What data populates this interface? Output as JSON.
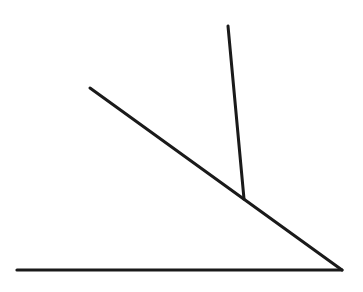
{
  "diagram": {
    "background": "#ffffff",
    "stroke_color": "#1a1a1a",
    "lines": [
      {
        "name": "base-line",
        "x1": 17,
        "y1": 270,
        "x2": 342,
        "y2": 270,
        "width": 3.2
      },
      {
        "name": "diagonal-line",
        "x1": 90,
        "y1": 88,
        "x2": 342,
        "y2": 270,
        "width": 3
      },
      {
        "name": "perpendicular-line",
        "x1": 228,
        "y1": 26,
        "x2": 244,
        "y2": 199,
        "width": 3
      }
    ]
  }
}
